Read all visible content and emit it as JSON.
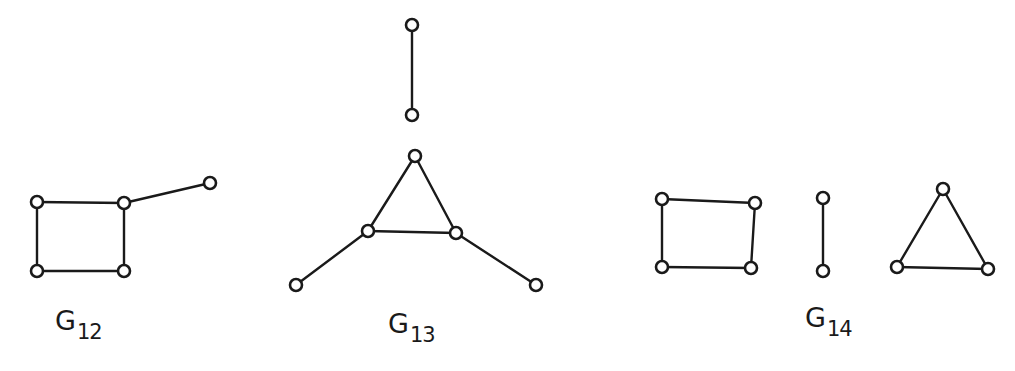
{
  "figure": {
    "background": "#ffffff",
    "ink_color": "#1a1a1a",
    "node_radius": 6,
    "graphs": [
      {
        "id": "G12",
        "label": {
          "main": "G",
          "sub": "12",
          "x": 55,
          "y": 307
        },
        "nodes": [
          {
            "id": "a",
            "x": 37,
            "y": 202
          },
          {
            "id": "b",
            "x": 124,
            "y": 203
          },
          {
            "id": "c",
            "x": 37,
            "y": 271
          },
          {
            "id": "d",
            "x": 124,
            "y": 271
          },
          {
            "id": "e",
            "x": 210,
            "y": 183
          }
        ],
        "edges": [
          [
            "a",
            "b"
          ],
          [
            "a",
            "c"
          ],
          [
            "c",
            "d"
          ],
          [
            "b",
            "d"
          ],
          [
            "b",
            "e"
          ]
        ]
      },
      {
        "id": "G13",
        "label": {
          "main": "G",
          "sub": "13",
          "x": 388,
          "y": 310
        },
        "nodes": [
          {
            "id": "p",
            "x": 412,
            "y": 25
          },
          {
            "id": "q",
            "x": 412,
            "y": 115
          },
          {
            "id": "t",
            "x": 415,
            "y": 156
          },
          {
            "id": "l",
            "x": 368,
            "y": 231
          },
          {
            "id": "r",
            "x": 456,
            "y": 233
          },
          {
            "id": "ll",
            "x": 296,
            "y": 285
          },
          {
            "id": "rr",
            "x": 536,
            "y": 285
          }
        ],
        "edges": [
          [
            "p",
            "q"
          ],
          [
            "t",
            "l"
          ],
          [
            "t",
            "r"
          ],
          [
            "l",
            "r"
          ],
          [
            "l",
            "ll"
          ],
          [
            "r",
            "rr"
          ]
        ]
      },
      {
        "id": "G14",
        "label": {
          "main": "G",
          "sub": "14",
          "x": 805,
          "y": 304
        },
        "nodes": [
          {
            "id": "s1",
            "x": 662,
            "y": 199
          },
          {
            "id": "s2",
            "x": 755,
            "y": 203
          },
          {
            "id": "s3",
            "x": 662,
            "y": 267
          },
          {
            "id": "s4",
            "x": 751,
            "y": 268
          },
          {
            "id": "k1",
            "x": 823,
            "y": 198
          },
          {
            "id": "k2",
            "x": 823,
            "y": 271
          },
          {
            "id": "t1",
            "x": 943,
            "y": 189
          },
          {
            "id": "t2",
            "x": 897,
            "y": 267
          },
          {
            "id": "t3",
            "x": 988,
            "y": 269
          }
        ],
        "edges": [
          [
            "s1",
            "s2"
          ],
          [
            "s1",
            "s3"
          ],
          [
            "s3",
            "s4"
          ],
          [
            "s2",
            "s4"
          ],
          [
            "k1",
            "k2"
          ],
          [
            "t1",
            "t2"
          ],
          [
            "t1",
            "t3"
          ],
          [
            "t2",
            "t3"
          ]
        ]
      }
    ]
  }
}
